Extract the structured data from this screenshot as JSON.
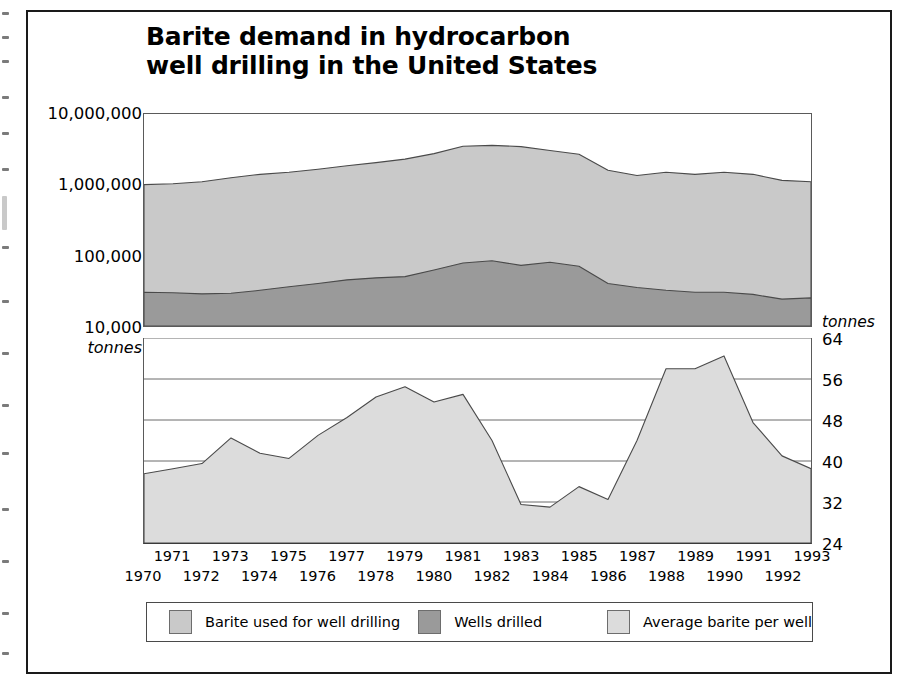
{
  "title": "Barite demand in hydrocarbon well drilling in the United States",
  "title_line1": "Barite demand in hydrocarbon",
  "title_line2": "well drilling in the United States",
  "colors": {
    "barite_area": "#c9c9c9",
    "wells_area": "#9a9a9a",
    "avg_area": "#dcdcdc",
    "line": "#4a4a4a",
    "frame": "#1a1a1a",
    "grid": "#6a6a6a"
  },
  "left_axis": {
    "units": "tonnes",
    "ticks": [
      "10,000,000",
      "1,000,000",
      "100,000",
      "10,000"
    ]
  },
  "right_axis": {
    "units": "tonnes",
    "ticks": [
      "64",
      "56",
      "48",
      "40",
      "32",
      "24"
    ]
  },
  "legend": {
    "items": [
      {
        "label": "Barite used for well drilling",
        "color": "#c9c9c9",
        "swatch": "barite-swatch"
      },
      {
        "label": "Wells drilled",
        "color": "#9a9a9a",
        "swatch": "wells-swatch"
      },
      {
        "label": "Average barite per well",
        "color": "#dcdcdc",
        "swatch": "average-swatch"
      }
    ]
  },
  "chart_data": [
    {
      "type": "area",
      "id": "upper",
      "title": "Barite demand in hydrocarbon well drilling in the United States",
      "xlabel": "",
      "ylabel": "tonnes",
      "yscale": "log",
      "ylim": [
        10000,
        10000000
      ],
      "yticks": [
        10000,
        100000,
        1000000,
        10000000
      ],
      "ytick_labels": [
        "10,000",
        "100,000",
        "1,000,000",
        "10,000,000"
      ],
      "grid": false,
      "legend_position": "bottom",
      "x": [
        1970,
        1971,
        1972,
        1973,
        1974,
        1975,
        1976,
        1977,
        1978,
        1979,
        1980,
        1981,
        1982,
        1983,
        1984,
        1985,
        1986,
        1987,
        1988,
        1989,
        1990,
        1991,
        1992,
        1993
      ],
      "series": [
        {
          "name": "Barite used for well drilling",
          "units": "tonnes",
          "color": "#c9c9c9",
          "values": [
            1000000,
            1030000,
            1100000,
            1250000,
            1400000,
            1500000,
            1650000,
            1850000,
            2050000,
            2300000,
            2750000,
            3500000,
            3600000,
            3450000,
            3050000,
            2700000,
            1600000,
            1350000,
            1500000,
            1400000,
            1500000,
            1400000,
            1150000,
            1100000
          ]
        },
        {
          "name": "Wells drilled",
          "units": "wells",
          "color": "#9a9a9a",
          "values": [
            30000,
            29500,
            28500,
            29000,
            32000,
            36000,
            40000,
            45000,
            48000,
            50000,
            62000,
            78000,
            84000,
            72000,
            80000,
            70000,
            40000,
            35000,
            32000,
            30000,
            30000,
            28000,
            24000,
            25000
          ]
        }
      ]
    },
    {
      "type": "area",
      "id": "lower",
      "title": "Average barite per well",
      "xlabel": "",
      "ylabel": "tonnes",
      "yscale": "linear",
      "ylim": [
        24,
        64
      ],
      "yticks": [
        24,
        32,
        40,
        48,
        56,
        64
      ],
      "grid": true,
      "x": [
        1970,
        1971,
        1972,
        1973,
        1974,
        1975,
        1976,
        1977,
        1978,
        1979,
        1980,
        1981,
        1982,
        1983,
        1984,
        1985,
        1986,
        1987,
        1988,
        1989,
        1990,
        1991,
        1992,
        1993
      ],
      "series": [
        {
          "name": "Average barite per well",
          "units": "tonnes",
          "color": "#dcdcdc",
          "values": [
            37.5,
            38.5,
            39.5,
            44.5,
            41.5,
            40.5,
            45.0,
            48.5,
            52.5,
            54.5,
            51.5,
            53.0,
            44.0,
            31.5,
            31.0,
            35.0,
            32.5,
            44.0,
            58.0,
            58.0,
            60.5,
            47.5,
            41.0,
            38.5
          ]
        }
      ]
    }
  ],
  "xaxis": {
    "years": [
      "1970",
      "1971",
      "1972",
      "1973",
      "1974",
      "1975",
      "1976",
      "1977",
      "1978",
      "1979",
      "1980",
      "1981",
      "1982",
      "1983",
      "1984",
      "1985",
      "1986",
      "1987",
      "1988",
      "1989",
      "1990",
      "1991",
      "1992",
      "1993"
    ]
  }
}
